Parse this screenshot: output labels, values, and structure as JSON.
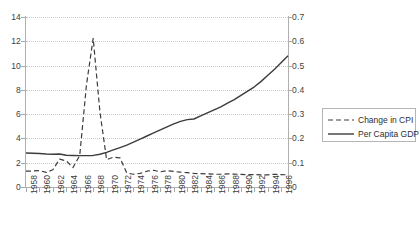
{
  "chart_data": {
    "type": "line",
    "title": "",
    "xlabel": "",
    "ylabel": "",
    "y2label": "",
    "grid": true,
    "legend_position": "right",
    "x": [
      1958,
      1959,
      1960,
      1961,
      1962,
      1963,
      1964,
      1965,
      1966,
      1967,
      1968,
      1969,
      1970,
      1971,
      1972,
      1973,
      1974,
      1975,
      1976,
      1977,
      1978,
      1979,
      1980,
      1981,
      1982,
      1983,
      1984,
      1985,
      1986,
      1987,
      1988,
      1989,
      1990,
      1991,
      1992,
      1993,
      1994,
      1995,
      1996,
      1997
    ],
    "xlim": [
      1958,
      1997
    ],
    "ylim": [
      0,
      14
    ],
    "y2lim": [
      0,
      0.7
    ],
    "y_ticks": [
      0,
      2,
      4,
      6,
      8,
      10,
      12,
      14
    ],
    "y2_ticks": [
      "0",
      "0.1",
      "0.2",
      "0.3",
      "0.4",
      "0.5",
      "0.6",
      "0.7"
    ],
    "x_tick_labels": [
      "1958",
      "1960",
      "1962",
      "1964",
      "1966",
      "1968",
      "1970",
      "1972",
      "1974",
      "1976",
      "1978",
      "1980",
      "1982",
      "1984",
      "1986",
      "1988",
      "1990",
      "1992",
      "1994",
      "1996"
    ],
    "x_tick_step": 2,
    "series": [
      {
        "name": "Change in CPI",
        "axis": "left",
        "style": "dashed",
        "color": "#3c3c3c",
        "values": [
          1.3,
          1.32,
          1.35,
          1.2,
          1.42,
          2.3,
          2.15,
          1.6,
          2.6,
          8.4,
          12.25,
          6.2,
          2.25,
          2.45,
          2.4,
          1.15,
          1.05,
          1.12,
          1.3,
          1.38,
          1.25,
          1.35,
          1.28,
          1.22,
          1.18,
          1.12,
          1.1,
          1.08,
          1.05,
          1.05,
          1.08,
          1.06,
          1.04,
          1.02,
          1.02,
          1.0,
          1.0,
          1.05,
          1.02,
          1.0
        ]
      },
      {
        "name": "Per Capita GDP",
        "axis": "left",
        "style": "solid",
        "color": "#3c3c3c",
        "values": [
          2.8,
          2.78,
          2.76,
          2.72,
          2.7,
          2.72,
          2.62,
          2.6,
          2.58,
          2.58,
          2.6,
          2.7,
          2.85,
          3.05,
          3.25,
          3.45,
          3.7,
          3.95,
          4.2,
          4.45,
          4.7,
          4.95,
          5.2,
          5.4,
          5.55,
          5.6,
          5.85,
          6.1,
          6.35,
          6.6,
          6.9,
          7.2,
          7.55,
          7.9,
          8.25,
          8.7,
          9.2,
          9.7,
          10.25,
          10.8
        ]
      }
    ]
  },
  "legend": {
    "items": [
      {
        "label": "Change in CPI",
        "style": "dashed"
      },
      {
        "label": "Per Capita GDP",
        "style": "solid"
      }
    ]
  },
  "colors": {
    "line": "#3c3c3c",
    "grid": "#c9c9c9",
    "axis": "#b0b0b0",
    "text": "#404040"
  }
}
